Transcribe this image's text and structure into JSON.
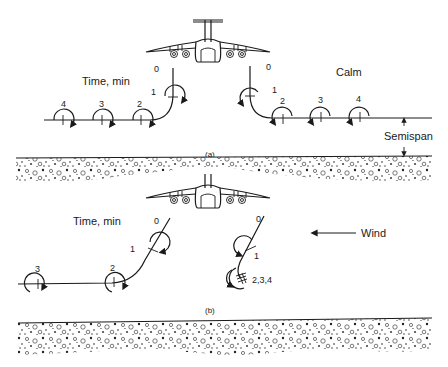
{
  "figure": {
    "panel_a": {
      "caption": "(a)",
      "time_label": "Time, min",
      "condition_label": "Calm",
      "semispan_label": "Semispan",
      "left_vortex_times": [
        "0",
        "1",
        "2",
        "3",
        "4"
      ],
      "right_vortex_times": [
        "0",
        "1",
        "2",
        "3",
        "4"
      ]
    },
    "panel_b": {
      "caption": "(b)",
      "time_label": "Time, min",
      "wind_label": "Wind",
      "left_vortex_times": [
        "0",
        "1",
        "2",
        "3"
      ],
      "right_vortex_times": [
        "0",
        "1",
        "2,3,4"
      ]
    }
  },
  "colors": {
    "ink": "#1a1a1a",
    "background": "#ffffff"
  }
}
